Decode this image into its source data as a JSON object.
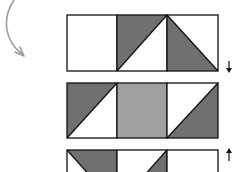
{
  "diagram": {
    "colors": {
      "dark": "#707070",
      "light": "#a0a0a0",
      "white": "#ffffff",
      "stroke": "#111111",
      "curve": "#9a9a9a"
    },
    "cell_size": 50,
    "origin_x": 67,
    "blocks": [
      {
        "y": 15,
        "height": 56,
        "cells": [
          {
            "fill": "none",
            "triangle": null
          },
          {
            "fill": "none",
            "triangle": "top-left"
          },
          {
            "fill": "none",
            "triangle": "bottom-left"
          }
        ],
        "arrow": "down"
      },
      {
        "y": 83,
        "height": 55,
        "cells": [
          {
            "fill": "none",
            "triangle": "top-left"
          },
          {
            "fill": "light",
            "triangle": null
          },
          {
            "fill": "none",
            "triangle": "bottom-right"
          }
        ],
        "arrow": null
      },
      {
        "y": 150,
        "height": 56,
        "cells": [
          {
            "fill": "none",
            "triangle": "top-right"
          },
          {
            "fill": "none",
            "triangle": "bottom-right"
          },
          {
            "fill": "none",
            "triangle": null
          }
        ],
        "arrow": "up"
      }
    ],
    "curved_arrow": {
      "direction": "down-right"
    }
  }
}
